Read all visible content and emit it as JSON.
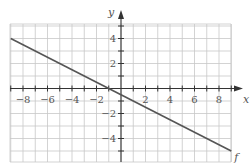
{
  "chart_data": {
    "type": "line",
    "title": "",
    "xlabel": "x",
    "ylabel": "y",
    "xlim": [
      -9,
      9
    ],
    "ylim": [
      -5.5,
      5.5
    ],
    "grid": true,
    "x_ticks": [
      -8,
      -6,
      -4,
      -2,
      2,
      4,
      6,
      8
    ],
    "y_ticks": [
      -4,
      -2,
      2,
      4
    ],
    "x_tick_labels": [
      "−8",
      "−6",
      "−4",
      "−2",
      "2",
      "4",
      "6",
      "8"
    ],
    "y_tick_labels": [
      "−4",
      "−2",
      "2",
      "4"
    ],
    "series": [
      {
        "name": "f",
        "equation": "f(x) = -x/2 - 1/2",
        "x": [
          -9,
          9
        ],
        "y": [
          4,
          -5
        ],
        "color": "#555555"
      }
    ],
    "annotations": [
      {
        "text": "f",
        "x": 9,
        "y": -5
      }
    ]
  },
  "colors": {
    "grid": "#c8c8c8",
    "axis": "#333333",
    "line": "#555555",
    "text": "#555555"
  }
}
